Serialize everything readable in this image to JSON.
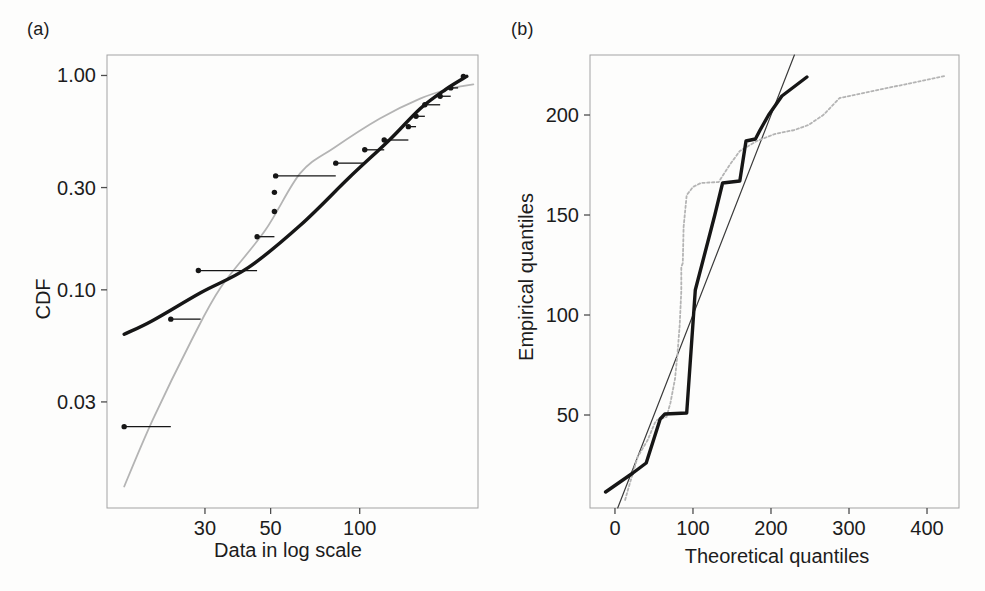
{
  "panels": {
    "a": {
      "label": "(a)",
      "xlabel": "Data in log scale",
      "ylabel": "CDF"
    },
    "b": {
      "label": "(b)",
      "xlabel": "Theoretical quantiles",
      "ylabel": "Empirical quantiles"
    }
  },
  "colors": {
    "curve_black": "#161616",
    "curve_gray": "#b4b4b4",
    "diagonal": "#3a3a3a",
    "frame": "#a3a3a3",
    "tick": "#4d4d4d",
    "text": "#1c1c1c",
    "background": "#fdfdfc"
  },
  "chart_data": [
    {
      "id": "a",
      "type": "line",
      "title": "",
      "xlabel": "Data in log scale",
      "ylabel": "CDF",
      "x_scale": "log",
      "y_scale": "log",
      "xlim": [
        14,
        251
      ],
      "ylim": [
        0.0096,
        1.246
      ],
      "grid": false,
      "legend": null,
      "x_ticks": [
        {
          "v": 30,
          "label": "30"
        },
        {
          "v": 50,
          "label": "50"
        },
        {
          "v": 100,
          "label": "100"
        }
      ],
      "y_ticks": [
        {
          "v": 1.0,
          "label": "1.00"
        },
        {
          "v": 0.3,
          "label": "0.30"
        },
        {
          "v": 0.1,
          "label": "0.10"
        },
        {
          "v": 0.03,
          "label": "0.03"
        }
      ],
      "series": [
        {
          "name": "gray-fitted-cdf",
          "style": "thin-gray",
          "smooth": true,
          "points": [
            [
              16,
              0.0121
            ],
            [
              20,
              0.0248
            ],
            [
              27,
              0.058
            ],
            [
              34,
              0.103
            ],
            [
              48,
              0.19
            ],
            [
              63,
              0.35
            ],
            [
              82,
              0.46
            ],
            [
              117,
              0.63
            ],
            [
              160,
              0.78
            ],
            [
              200,
              0.865
            ],
            [
              225,
              0.895
            ],
            [
              242,
              0.91
            ]
          ]
        },
        {
          "name": "black-fitted-cdf",
          "style": "thick-black",
          "smooth": true,
          "points": [
            [
              16,
              0.062
            ],
            [
              20,
              0.072
            ],
            [
              29,
              0.097
            ],
            [
              42,
              0.127
            ],
            [
              63,
              0.2
            ],
            [
              92,
              0.333
            ],
            [
              126,
              0.5
            ],
            [
              160,
              0.7
            ],
            [
              195,
              0.86
            ],
            [
              230,
              0.99
            ]
          ]
        }
      ],
      "empirical_points": [
        {
          "v": 16,
          "cdf": 0.023,
          "step_to": 23
        },
        {
          "v": 23,
          "cdf": 0.073,
          "step_to": 29
        },
        {
          "v": 28.5,
          "cdf": 0.123,
          "step_to": 45
        },
        {
          "v": 45,
          "cdf": 0.177,
          "step_to": 51.5
        },
        {
          "v": 51.5,
          "cdf": 0.232,
          "step_to": null
        },
        {
          "v": 51.5,
          "cdf": 0.285,
          "step_to": null
        },
        {
          "v": 52,
          "cdf": 0.34,
          "step_to": 83
        },
        {
          "v": 83,
          "cdf": 0.39,
          "step_to": 104
        },
        {
          "v": 104,
          "cdf": 0.45,
          "step_to": 121
        },
        {
          "v": 121,
          "cdf": 0.5,
          "step_to": 146
        },
        {
          "v": 146,
          "cdf": 0.577,
          "step_to": 155
        },
        {
          "v": 155,
          "cdf": 0.645,
          "step_to": 166
        },
        {
          "v": 166,
          "cdf": 0.73,
          "step_to": 187
        },
        {
          "v": 187,
          "cdf": 0.8,
          "step_to": 203
        },
        {
          "v": 203,
          "cdf": 0.875,
          "step_to": 215
        },
        {
          "v": 224,
          "cdf": 0.99,
          "step_to": null
        }
      ]
    },
    {
      "id": "b",
      "type": "line",
      "title": "",
      "xlabel": "Theoretical quantiles",
      "ylabel": "Empirical quantiles",
      "x_scale": "linear",
      "y_scale": "linear",
      "xlim": [
        -32,
        441
      ],
      "ylim": [
        3.5,
        230
      ],
      "grid": false,
      "legend": null,
      "x_ticks": [
        {
          "v": 0,
          "label": "0"
        },
        {
          "v": 100,
          "label": "100"
        },
        {
          "v": 200,
          "label": "200"
        },
        {
          "v": 300,
          "label": "300"
        },
        {
          "v": 400,
          "label": "400"
        }
      ],
      "y_ticks": [
        {
          "v": 50,
          "label": "50"
        },
        {
          "v": 100,
          "label": "100"
        },
        {
          "v": 150,
          "label": "150"
        },
        {
          "v": 200,
          "label": "200"
        }
      ],
      "series": [
        {
          "name": "identity-line",
          "style": "thin-dark",
          "smooth": false,
          "points": [
            [
              3.5,
              3.5
            ],
            [
              230,
              230
            ]
          ]
        },
        {
          "name": "gray-qq-line",
          "style": "dotted-gray",
          "smooth": false,
          "points": [
            [
              13,
              7.5
            ],
            [
              17,
              13
            ],
            [
              29,
              29
            ],
            [
              42,
              37.5
            ],
            [
              51,
              46
            ],
            [
              54,
              47.5
            ],
            [
              66,
              49
            ],
            [
              71,
              56
            ],
            [
              77,
              68
            ],
            [
              80,
              80
            ],
            [
              83,
              95
            ],
            [
              85,
              112
            ],
            [
              85,
              124
            ],
            [
              87,
              126
            ],
            [
              88,
              144
            ],
            [
              92,
              160
            ],
            [
              100,
              164
            ],
            [
              110,
              166
            ],
            [
              133,
              166.5
            ],
            [
              147,
              175
            ],
            [
              160,
              182
            ],
            [
              182,
              187
            ],
            [
              205,
              190.5
            ],
            [
              230,
              192.5
            ],
            [
              248,
              195
            ],
            [
              267,
              200
            ],
            [
              288,
              208.5
            ],
            [
              423,
              219.5
            ]
          ]
        },
        {
          "name": "black-qq-line",
          "style": "thick-black",
          "smooth": false,
          "points": [
            [
              -12,
              11.5
            ],
            [
              23,
              21
            ],
            [
              40,
              26
            ],
            [
              58,
              48
            ],
            [
              64,
              50.5
            ],
            [
              92,
              51
            ],
            [
              103,
              112.5
            ],
            [
              124,
              144
            ],
            [
              128,
              150
            ],
            [
              138,
              166
            ],
            [
              160,
              167
            ],
            [
              168,
              187
            ],
            [
              180,
              188
            ],
            [
              186,
              192.5
            ],
            [
              197,
              200
            ],
            [
              214,
              209.5
            ],
            [
              246,
              219
            ]
          ]
        }
      ]
    }
  ]
}
